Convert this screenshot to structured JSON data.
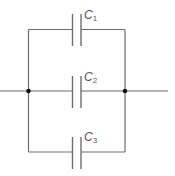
{
  "diagram": {
    "type": "parallel-capacitor-circuit",
    "colors": {
      "wire": "#6e6e6e",
      "node": "#111111",
      "label": "#555555"
    },
    "capacitors": [
      {
        "id": "C1",
        "letter": "C",
        "sub": "1"
      },
      {
        "id": "C2",
        "letter": "C",
        "sub": "2"
      },
      {
        "id": "C3",
        "letter": "C",
        "sub": "3"
      }
    ]
  }
}
